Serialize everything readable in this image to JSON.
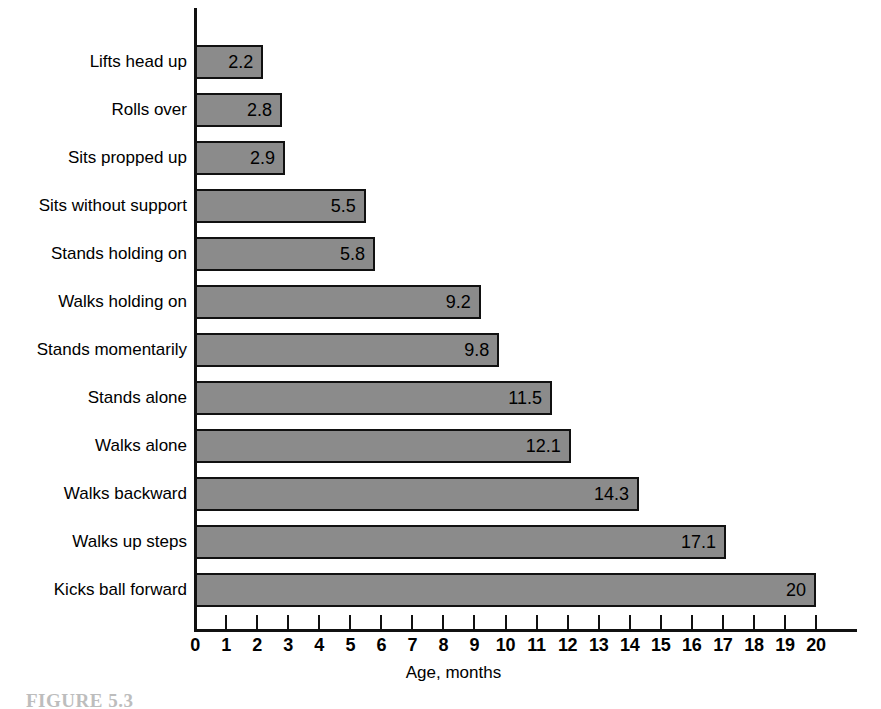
{
  "chart_data": {
    "type": "bar",
    "orientation": "horizontal",
    "title": "",
    "xlabel": "Age, months",
    "ylabel": "",
    "xlim": [
      0,
      20
    ],
    "xticks": [
      "0",
      "1",
      "2",
      "3",
      "4",
      "5",
      "6",
      "7",
      "8",
      "9",
      "10",
      "11",
      "12",
      "13",
      "14",
      "15",
      "16",
      "17",
      "18",
      "19",
      "20"
    ],
    "grid": false,
    "legend": null,
    "bar_color": "#8b8b8b",
    "bar_edge_color": "#111111",
    "categories": [
      "Lifts head up",
      "Rolls over",
      "Sits propped up",
      "Sits without support",
      "Stands holding on",
      "Walks holding on",
      "Stands momentarily",
      "Stands alone",
      "Walks alone",
      "Walks backward",
      "Walks up steps",
      "Kicks ball forward"
    ],
    "values": [
      2.2,
      2.8,
      2.9,
      5.5,
      5.8,
      9.2,
      9.8,
      11.5,
      12.1,
      14.3,
      17.1,
      20
    ],
    "value_labels": [
      "2.2",
      "2.8",
      "2.9",
      "5.5",
      "5.8",
      "9.2",
      "9.8",
      "11.5",
      "12.1",
      "14.3",
      "17.1",
      "20"
    ]
  },
  "caption": {
    "text": "FIGURE 5.3"
  }
}
